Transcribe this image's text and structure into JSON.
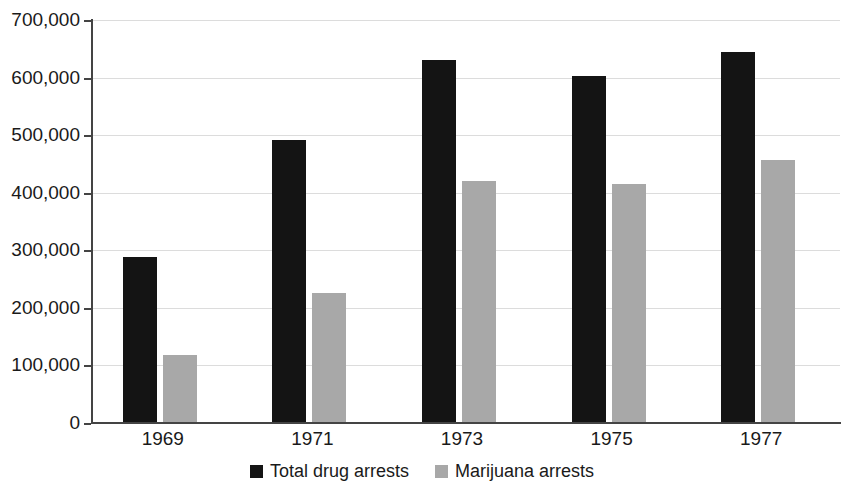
{
  "chart_data": {
    "type": "bar",
    "title": "",
    "subtitle": "",
    "xlabel": "",
    "ylabel": "",
    "categories": [
      "1969",
      "1971",
      "1973",
      "1975",
      "1977"
    ],
    "series": [
      {
        "name": "Total drug arrests",
        "color": "#141414",
        "values": [
          288000,
          492000,
          630000,
          603000,
          645000
        ]
      },
      {
        "name": "Marijuana arrests",
        "color": "#a8a8a8",
        "values": [
          118000,
          225000,
          420000,
          416000,
          457000
        ]
      }
    ],
    "ylim": [
      0,
      700000
    ],
    "ytick_values": [
      0,
      100000,
      200000,
      300000,
      400000,
      500000,
      600000,
      700000
    ],
    "ytick_labels": [
      "0",
      "100,000",
      "200,000",
      "300,000",
      "400,000",
      "500,000",
      "600,000",
      "700,000"
    ],
    "grid": true,
    "grid_axis": "y",
    "grid_color": "#dcdcdc",
    "legend_position": "bottom",
    "legend_entries": [
      "Total drug arrests",
      "Marijuana arrests"
    ],
    "axis_color": "#444444",
    "background_color": "#ffffff"
  }
}
